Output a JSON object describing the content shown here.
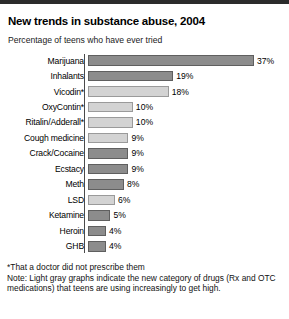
{
  "header": {
    "title": "New trends in substance abuse, 2004",
    "subtitle": "Percentage of teens who have ever tried"
  },
  "notes": {
    "footnote": "*That a doctor did not prescribe them",
    "note_line1": "Note: Light gray graphs indicate the new category of drugs (Rx and OTC",
    "note_line2": "medications) that teens are using increasingly to get high."
  },
  "colors": {
    "dark_bar": "#8c8c8c",
    "light_bar": "#d3d3d3",
    "top_band": "#2b2b2b"
  },
  "chart_data": {
    "type": "bar",
    "orientation": "horizontal",
    "title": "New trends in substance abuse, 2004",
    "subtitle": "Percentage of teens who have ever tried",
    "xlabel": "",
    "ylabel": "",
    "xlim": [
      0,
      37
    ],
    "grid": false,
    "legend": "none",
    "value_suffix": "%",
    "categories": [
      "Marijuana",
      "Inhalants",
      "Vicodin*",
      "OxyContin*",
      "Ritalin/Adderall*",
      "Cough medicine",
      "Crack/Cocaine",
      "Ecstacy",
      "Meth",
      "LSD",
      "Ketamine",
      "Heroin",
      "GHB"
    ],
    "values": [
      37,
      19,
      18,
      10,
      10,
      9,
      9,
      9,
      8,
      6,
      5,
      4,
      4
    ],
    "value_labels": [
      "37%",
      "19%",
      "18%",
      "10%",
      "10%",
      "9%",
      "9%",
      "9%",
      "8%",
      "6%",
      "5%",
      "4%",
      "4%"
    ],
    "bar_shades": [
      "dark",
      "dark",
      "light",
      "light",
      "light",
      "light",
      "dark",
      "dark",
      "dark",
      "light",
      "dark",
      "dark",
      "dark"
    ],
    "bars": [
      {
        "label": "Marijuana",
        "value": 37,
        "value_label": "37%",
        "shade": "dark"
      },
      {
        "label": "Inhalants",
        "value": 19,
        "value_label": "19%",
        "shade": "dark"
      },
      {
        "label": "Vicodin*",
        "value": 18,
        "value_label": "18%",
        "shade": "light"
      },
      {
        "label": "OxyContin*",
        "value": 10,
        "value_label": "10%",
        "shade": "light"
      },
      {
        "label": "Ritalin/Adderall*",
        "value": 10,
        "value_label": "10%",
        "shade": "light"
      },
      {
        "label": "Cough medicine",
        "value": 9,
        "value_label": "9%",
        "shade": "light"
      },
      {
        "label": "Crack/Cocaine",
        "value": 9,
        "value_label": "9%",
        "shade": "dark"
      },
      {
        "label": "Ecstacy",
        "value": 9,
        "value_label": "9%",
        "shade": "dark"
      },
      {
        "label": "Meth",
        "value": 8,
        "value_label": "8%",
        "shade": "dark"
      },
      {
        "label": "LSD",
        "value": 6,
        "value_label": "6%",
        "shade": "light"
      },
      {
        "label": "Ketamine",
        "value": 5,
        "value_label": "5%",
        "shade": "dark"
      },
      {
        "label": "Heroin",
        "value": 4,
        "value_label": "4%",
        "shade": "dark"
      },
      {
        "label": "GHB",
        "value": 4,
        "value_label": "4%",
        "shade": "dark"
      }
    ]
  }
}
